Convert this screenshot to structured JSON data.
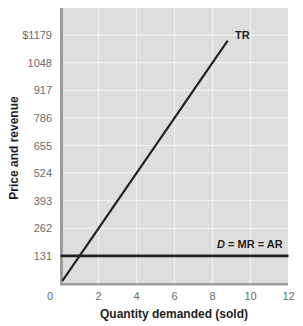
{
  "chart_data": {
    "type": "line",
    "title": "",
    "xlabel": "Quantity demanded (sold)",
    "ylabel": "Price and revenue",
    "xlim": [
      0,
      12
    ],
    "ylim": [
      0,
      1310
    ],
    "x_ticks": [
      "0",
      "2",
      "4",
      "6",
      "8",
      "10",
      "12"
    ],
    "x_tick_values": [
      0,
      2,
      4,
      6,
      8,
      10,
      12
    ],
    "y_ticks": [
      "131",
      "262",
      "393",
      "524",
      "655",
      "786",
      "917",
      "1048",
      "$1179"
    ],
    "y_tick_values": [
      131,
      262,
      393,
      524,
      655,
      786,
      917,
      1048,
      1179
    ],
    "grid": true,
    "legend": "none (inline curve labels)",
    "series": [
      {
        "name": "TR",
        "label": "TR",
        "x": [
          0.1,
          8.8
        ],
        "y": [
          13,
          1153
        ],
        "note": "Total revenue = 131 × quantity"
      },
      {
        "name": "D = MR = AR",
        "label_italic": "D",
        "label_rest": " = MR = AR",
        "x": [
          0,
          12
        ],
        "y": [
          131,
          131
        ]
      }
    ]
  },
  "colors": {
    "plot_background": "#dedede",
    "gridline": "#f2f2f2",
    "axis_bar": "#9c9c9c",
    "line": "#222222",
    "tick_text": "#6b6b6b",
    "title_text": "#1e1e1e"
  }
}
